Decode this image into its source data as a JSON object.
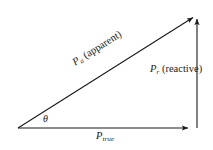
{
  "figure": {
    "type": "power-triangle-vector-diagram",
    "background_color": "#ffffff",
    "stroke_color": "#1a1a1a",
    "text_color": "#1a1a1a"
  },
  "labels": {
    "apparent": {
      "symbol": "P",
      "subscript": "a",
      "qualifier": "(apparent)"
    },
    "reactive": {
      "symbol": "P",
      "subscript": "r",
      "qualifier": "(reactive)"
    },
    "true_power": {
      "symbol": "P",
      "subscript": "true"
    },
    "angle": {
      "symbol": "θ"
    }
  },
  "geometry": {
    "origin": {
      "x": 18,
      "y": 128
    },
    "horizontal_tip": {
      "x": 192,
      "y": 128
    },
    "vertical_base": {
      "x": 197,
      "y": 128
    },
    "vertical_tip": {
      "x": 197,
      "y": 15
    },
    "hypotenuse_tip": {
      "x": 197,
      "y": 15
    },
    "angle_degrees": 32
  }
}
